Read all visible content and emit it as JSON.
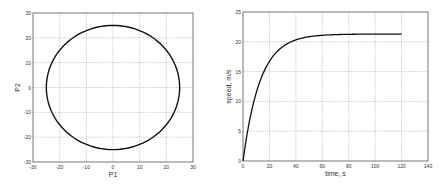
{
  "chart_data": [
    {
      "type": "line",
      "title": "",
      "xlabel": "P1",
      "ylabel": "P2",
      "xlim": [
        -30,
        30
      ],
      "ylim": [
        -30,
        30
      ],
      "xticks": [
        "-30",
        "-20",
        "-10",
        "0",
        "10",
        "20",
        "30"
      ],
      "yticks": [
        "-30",
        "-20",
        "-10",
        "0",
        "10",
        "20",
        "30"
      ],
      "grid": true,
      "description": "Closed circular trajectory centered at origin, radius ~25",
      "series": [
        {
          "name": "trajectory",
          "x": [
            25,
            21.7,
            12.5,
            0,
            -12.5,
            -21.7,
            -25,
            -21.7,
            -12.5,
            0,
            12.5,
            21.7,
            25
          ],
          "y": [
            0,
            12.5,
            21.7,
            25,
            21.7,
            12.5,
            0,
            -12.5,
            -21.7,
            -25,
            -21.7,
            -12.5,
            0
          ]
        }
      ]
    },
    {
      "type": "line",
      "title": "",
      "xlabel": "time, s",
      "ylabel": "speed, m/s",
      "xlim": [
        0,
        140
      ],
      "ylim": [
        0,
        25
      ],
      "xticks": [
        "0",
        "20",
        "40",
        "60",
        "80",
        "100",
        "120",
        "140"
      ],
      "yticks": [
        "0",
        "5",
        "10",
        "15",
        "20",
        "25"
      ],
      "grid": true,
      "series": [
        {
          "name": "speed",
          "x": [
            0,
            5,
            10,
            15,
            20,
            25,
            30,
            40,
            50,
            60,
            80,
            100,
            120
          ],
          "y": [
            0,
            6,
            10.5,
            14,
            16.5,
            18.2,
            19.3,
            20.5,
            21.0,
            21.2,
            21.3,
            21.3,
            21.3
          ]
        }
      ]
    }
  ]
}
